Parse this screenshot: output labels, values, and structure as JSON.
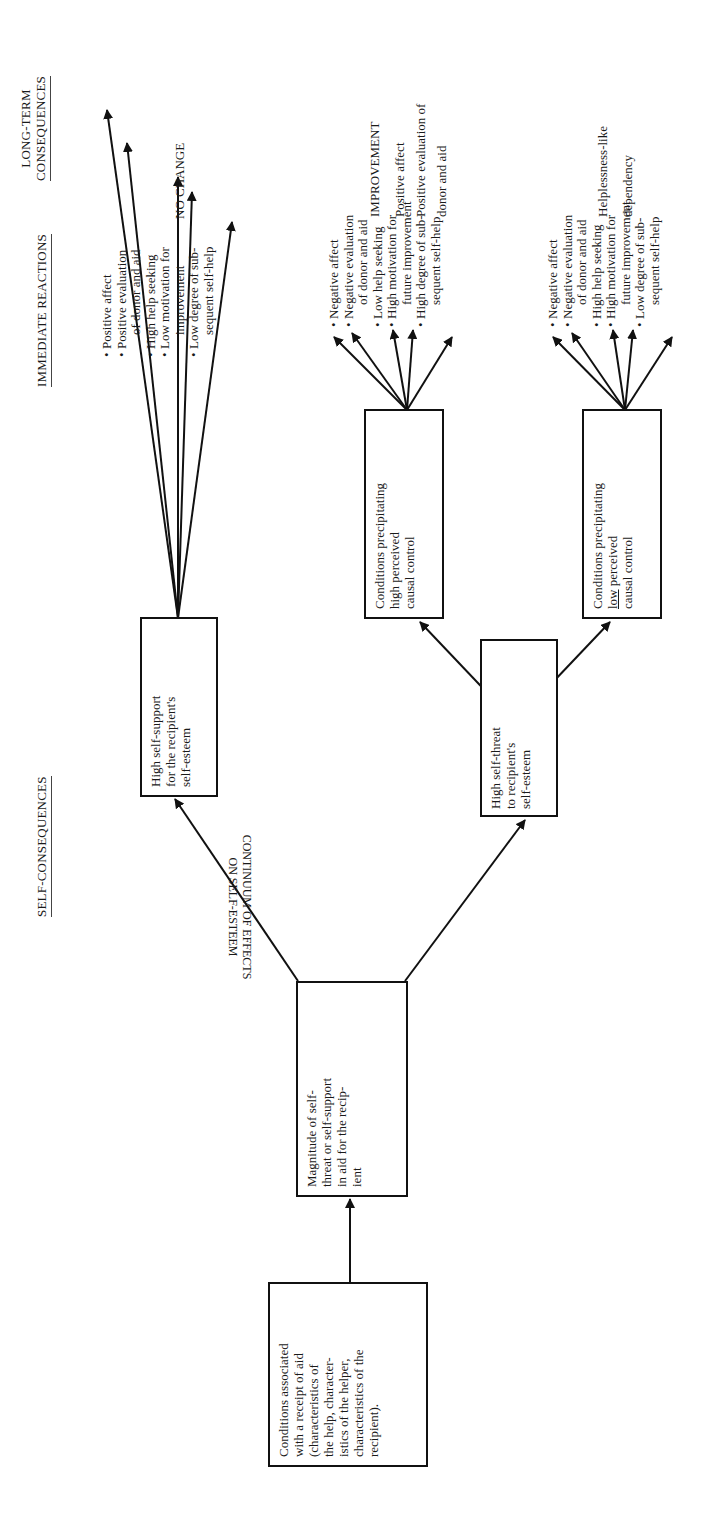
{
  "headers": {
    "self_consequences": "SELF-CONSEQUENCES",
    "immediate_reactions": "IMMEDIATE REACTIONS",
    "long_term_line1": "LONG-TERM",
    "long_term_line2": "CONSEQUENCES"
  },
  "continuum_label": {
    "line1": "CONTINUUM OF EFFECTS",
    "line2": "ON SELF-ESTEEM"
  },
  "boxes": {
    "conditions": {
      "lines": [
        "Conditions associated",
        "with a receipt of aid",
        "(characteristics of",
        "the help, character-",
        "istics of the helper,",
        "characteristics of the",
        "recipient)."
      ]
    },
    "magnitude": {
      "lines": [
        "Magnitude of self-",
        "threat or self-support",
        "in aid for the recip-",
        "ient"
      ]
    },
    "self_support": {
      "lines": [
        "High self-support",
        "for the recipient's",
        "self-esteem"
      ]
    },
    "self_threat": {
      "lines": [
        "High self-threat",
        "to recipient's",
        "self-esteem"
      ]
    },
    "high_control": {
      "lines": [
        "Conditions precipitating",
        "high perceived",
        "causal control"
      ]
    },
    "low_control": {
      "lines": [
        "Conditions precipitating",
        "low perceived",
        "causal control"
      ],
      "underlined_word": "low"
    }
  },
  "reactions": {
    "support": [
      {
        "line1": "Positive affect"
      },
      {
        "line1": "Positive evaluation",
        "line2": "of donor and aid"
      },
      {
        "line1": "High help seeking"
      },
      {
        "line1": "Low motivation for",
        "line2": "improvement"
      },
      {
        "line1": "Low degree of sub-",
        "line2": "sequent self-help"
      }
    ],
    "high_control": [
      {
        "line1": "Negative affect"
      },
      {
        "line1": "Negative evaluation",
        "line2": "of donor and aid"
      },
      {
        "line1": "Low help seeking"
      },
      {
        "line1": "High motivation for",
        "line2": "future improvement"
      },
      {
        "line1": "High degree of sub-",
        "line2": "sequent self-help"
      }
    ],
    "low_control": [
      {
        "line1": "Negative affect"
      },
      {
        "line1": "Negative evaluation",
        "line2": "of donor and aid"
      },
      {
        "line1": "High help seeking"
      },
      {
        "line1": "High motivation for",
        "line2": "future improvement"
      },
      {
        "line1": "Low degree of sub-",
        "line2": "sequent self-help"
      }
    ]
  },
  "long_term": {
    "support": {
      "title": "NO CHANGE"
    },
    "high_control": {
      "title": "IMPROVEMENT",
      "line1": "Positive affect",
      "line2": "Positive evaluation of",
      "line3": "donor and aid"
    },
    "low_control": {
      "line1": "Helplessness-like",
      "line2": "dependency"
    }
  },
  "colors": {
    "ink": "#111111",
    "text": "#1a1a1a",
    "background": "#ffffff"
  }
}
